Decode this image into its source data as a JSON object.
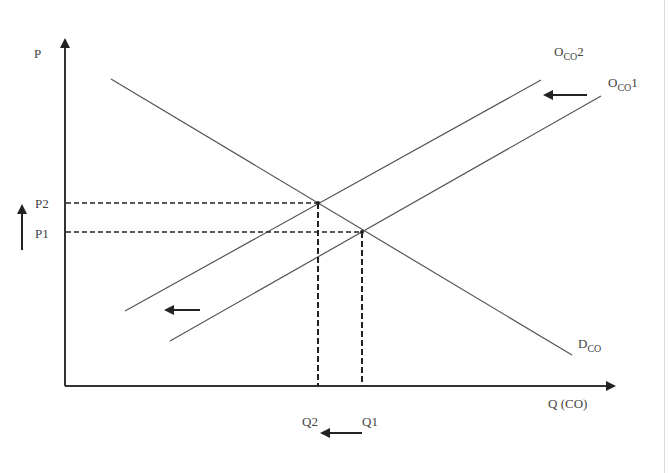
{
  "diagram": {
    "type": "supply-demand-shift",
    "axes": {
      "y_label": "P",
      "x_label": "Q (CO)"
    },
    "curves": [
      {
        "id": "supply2",
        "label_main": "O",
        "label_sub": "CO",
        "label_suffix": "2",
        "kind": "supply"
      },
      {
        "id": "supply1",
        "label_main": "O",
        "label_sub": "CO",
        "label_suffix": "1",
        "kind": "supply"
      },
      {
        "id": "demand",
        "label_main": "D",
        "label_sub": "CO",
        "label_suffix": "",
        "kind": "demand"
      }
    ],
    "price_levels": [
      {
        "label": "P2"
      },
      {
        "label": "P1"
      }
    ],
    "quantity_levels": [
      {
        "label": "Q2"
      },
      {
        "label": "Q1"
      }
    ],
    "annotations": {
      "price_arrow": "up",
      "quantity_arrow": "left",
      "supply_shift_arrow": "left"
    },
    "colors": {
      "line": "#333333",
      "text": "#444444"
    }
  }
}
